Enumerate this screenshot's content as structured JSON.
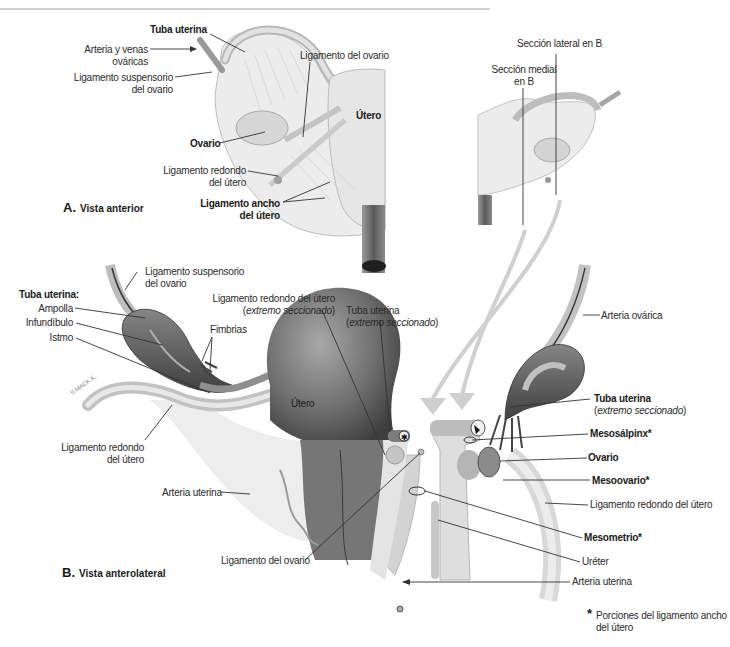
{
  "panel_a": {
    "title_letter": "A.",
    "title": "Vista anterior",
    "labels": {
      "tuba_uterina": "Tuba uterina",
      "arteria_venas_1": "Arteria y venas",
      "arteria_venas_2": "ováricas",
      "lig_suspensorio_1": "Ligamento suspensorio",
      "lig_suspensorio_2": "del ovario",
      "lig_ovario": "Ligamento del ovario",
      "utero": "Útero",
      "ovario": "Ovario",
      "lig_redondo_1": "Ligamento redondo",
      "lig_redondo_2": "del útero",
      "lig_ancho_1": "Ligamento ancho",
      "lig_ancho_2": "del útero"
    },
    "section_labels": {
      "lateral": "Sección lateral en B",
      "medial_1": "Sección medial",
      "medial_2": "en B"
    }
  },
  "panel_b": {
    "title_letter": "B.",
    "title": "Vista anterolateral",
    "labels": {
      "lig_suspensorio_1": "Ligamento suspensorio",
      "lig_suspensorio_2": "del ovario",
      "tuba_uterina_header": "Tuba uterina:",
      "ampolla": "Ampolla",
      "infundibulo": "Infundíbulo",
      "istmo": "Istmo",
      "fimbrias": "Fimbrias",
      "lig_redondo_cut_1": "Ligamento redondo del útero",
      "lig_redondo_cut_2_open": "(",
      "lig_redondo_cut_2_italic": "extremo seccionado",
      "lig_redondo_cut_2_close": ")",
      "tuba_cut_1": "Tuba uterina",
      "tuba_cut_2_open": "(",
      "tuba_cut_2_italic": "extremo seccionado",
      "tuba_cut_2_close": ")",
      "utero": "Útero",
      "lig_redondo_1": "Ligamento redondo",
      "lig_redondo_2": "del útero",
      "arteria_uterina_left": "Arteria uterina",
      "lig_ovario": "Ligamento del ovario",
      "arteria_ovarica": "Arteria ovárica",
      "tuba_right_1": "Tuba uterina",
      "tuba_right_2_open": "(",
      "tuba_right_2_italic": "extremo seccionado",
      "tuba_right_2_close": ")",
      "mesosalpinx": "Mesosálpinx*",
      "ovario": "Ovario",
      "mesoovario": "Mesoovario*",
      "lig_redondo_right": "Ligamento redondo del útero",
      "mesometrio": "Mesometrio*",
      "ureter": "Uréter",
      "arteria_uterina_right": "Arteria uterina",
      "signature": "S.MACK.K."
    }
  },
  "footnote": {
    "asterisk": "*",
    "line1": "Porciones del ligamento ancho",
    "line2": "del útero"
  },
  "colors": {
    "organ_dark": "#5a5a5a",
    "organ_mid": "#8c8c8c",
    "tissue_light": "#d9d9d9",
    "leader_line": "#333333",
    "arrow_fill": "#cfcfcf"
  }
}
